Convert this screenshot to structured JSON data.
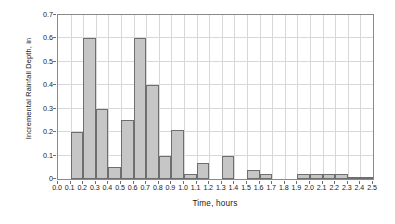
{
  "chart_data": {
    "type": "bar",
    "title": "",
    "subtitle": "",
    "xlabel": "Time, hours",
    "ylabel": "Incremental Rainfall Depth, in",
    "xlim": [
      0.0,
      2.5
    ],
    "ylim": [
      0.0,
      0.7
    ],
    "grid": true,
    "legend": null,
    "bar_width": 0.1,
    "bar_fill_color": "#c6c6c6",
    "bar_edge_color": "#6e6e6e",
    "grid_color": "#d8d8d8",
    "axis_color": "#8a8a8a",
    "text_color": "#1a1a1a",
    "x_tick_labels": [
      "0.0",
      "0.1",
      "0.2",
      "0.3",
      "0.4",
      "0.5",
      "0.6",
      "0.7",
      "0.8",
      "0.9",
      "1.0",
      "1.1",
      "1.2",
      "1.3",
      "1.4",
      "1.5",
      "1.6",
      "1.7",
      "1.8",
      "1.9",
      "2.0",
      "2.1",
      "2.2",
      "2.3",
      "2.4",
      "2.5"
    ],
    "x_tick_values": [
      0.0,
      0.1,
      0.2,
      0.3,
      0.4,
      0.5,
      0.6,
      0.7,
      0.8,
      0.9,
      1.0,
      1.1,
      1.2,
      1.3,
      1.4,
      1.5,
      1.6,
      1.7,
      1.8,
      1.9,
      2.0,
      2.1,
      2.2,
      2.3,
      2.4,
      2.5
    ],
    "y_tick_labels": [
      "0",
      "0.1",
      "0.2",
      "0.3",
      "0.4",
      "0.5",
      "0.6",
      "0.7"
    ],
    "y_tick_values": [
      0.0,
      0.1,
      0.2,
      0.3,
      0.4,
      0.5,
      0.6,
      0.7
    ],
    "bar_left_edges": [
      0.1,
      0.2,
      0.3,
      0.4,
      0.5,
      0.6,
      0.7,
      0.8,
      0.9,
      1.0,
      1.1,
      1.2,
      1.3,
      1.4,
      1.5,
      1.6,
      1.7,
      1.8,
      1.9,
      2.0,
      2.1,
      2.2,
      2.3,
      2.4
    ],
    "categories": [
      "0.1-0.2",
      "0.2-0.3",
      "0.3-0.4",
      "0.4-0.5",
      "0.5-0.6",
      "0.6-0.7",
      "0.7-0.8",
      "0.8-0.9",
      "0.9-1.0",
      "1.0-1.1",
      "1.1-1.2",
      "1.2-1.3",
      "1.3-1.4",
      "1.4-1.5",
      "1.5-1.6",
      "1.6-1.7",
      "1.7-1.8",
      "1.8-1.9",
      "1.9-2.0",
      "2.0-2.1",
      "2.1-2.2",
      "2.2-2.3",
      "2.3-2.4",
      "2.4-2.5"
    ],
    "values": [
      0.2,
      0.6,
      0.3,
      0.05,
      0.25,
      0.6,
      0.4,
      0.1,
      0.21,
      0.02,
      0.07,
      0.0,
      0.1,
      0.0,
      0.04,
      0.02,
      0.0,
      0.0,
      0.02,
      0.02,
      0.02,
      0.02,
      0.01,
      0.01
    ]
  }
}
